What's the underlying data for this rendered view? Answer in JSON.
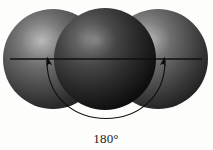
{
  "figure": {
    "background_color": "#fdfdfc",
    "annotation": {
      "angle_label": "180°",
      "label_x": 106,
      "label_y": 143
    },
    "axis_line": {
      "name": "bond-axis-line",
      "x1": 10,
      "y1": 59,
      "x2": 202,
      "y2": 59,
      "color": "#111111",
      "width": 1.3
    },
    "atoms": [
      {
        "name": "left-atom",
        "cx": 53,
        "cy": 59,
        "r": 50,
        "base_color": "#4a4a4a",
        "highlight_color": "#9a9a9a",
        "shadow_color": "#181818",
        "highlight_x": 42,
        "highlight_y": 41
      },
      {
        "name": "center-atom",
        "cx": 105,
        "cy": 59,
        "r": 51,
        "base_color": "#2b2b2b",
        "highlight_color": "#777777",
        "shadow_color": "#050505",
        "highlight_x": 96,
        "highlight_y": 40
      },
      {
        "name": "right-atom",
        "cx": 158,
        "cy": 59,
        "r": 50,
        "base_color": "#4a4a4a",
        "highlight_color": "#9a9a9a",
        "shadow_color": "#181818",
        "highlight_x": 150,
        "highlight_y": 40
      }
    ],
    "angle_arc": {
      "name": "angle-arc",
      "color": "#0e0e0e",
      "width": 1.1,
      "start_x": 47,
      "start_y": 60,
      "end_x": 165,
      "end_y": 60,
      "control1_x": 46,
      "control1_y": 138,
      "control2_x": 166,
      "control2_y": 138
    },
    "arrowheads": [
      {
        "name": "left-arrowhead",
        "tip_x": 47,
        "tip_y": 57,
        "rotation": -16
      },
      {
        "name": "right-arrowhead",
        "tip_x": 165,
        "tip_y": 57,
        "rotation": 16
      }
    ]
  }
}
